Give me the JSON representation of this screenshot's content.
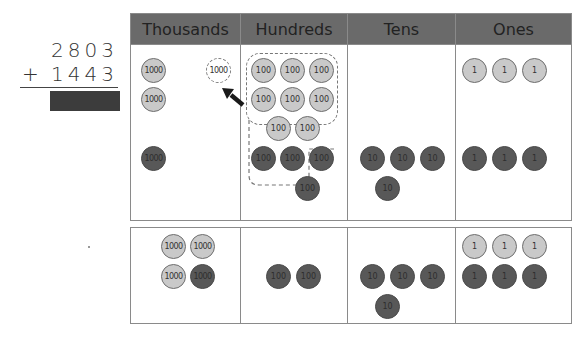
{
  "problem": {
    "addend1": "2803",
    "operator": "+",
    "addend2": "1443",
    "answer_hidden": true
  },
  "headers": [
    "Thousands",
    "Hundreds",
    "Tens",
    "Ones"
  ],
  "top_chart": {
    "thousands": {
      "light_discs": [
        "1000",
        "1000"
      ],
      "dark_discs": [
        "1000"
      ],
      "regrouped_ghost_disc": "1000"
    },
    "hundreds": {
      "light_discs": [
        "100",
        "100",
        "100",
        "100",
        "100",
        "100",
        "100",
        "100"
      ],
      "dark_discs": [
        "100",
        "100",
        "100",
        "100"
      ],
      "regrouped_group_count": 10
    },
    "tens": {
      "light_discs": [],
      "dark_discs": [
        "10",
        "10",
        "10",
        "10"
      ]
    },
    "ones": {
      "light_discs": [
        "1",
        "1",
        "1"
      ],
      "dark_discs": [
        "1",
        "1",
        "1"
      ]
    }
  },
  "bottom_chart": {
    "thousands": {
      "light_discs": [
        "1000",
        "1000",
        "1000"
      ],
      "dark_discs": [
        "1000"
      ]
    },
    "hundreds": {
      "light_discs": [],
      "dark_discs": [
        "100",
        "100"
      ]
    },
    "tens": {
      "light_discs": [],
      "dark_discs": [
        "10",
        "10",
        "10",
        "10"
      ]
    },
    "ones": {
      "light_discs": [
        "1",
        "1",
        "1"
      ],
      "dark_discs": [
        "1",
        "1",
        "1"
      ]
    }
  },
  "colors": {
    "header_bg": "#6a6a6a",
    "light_disc": "#c9c9c9",
    "dark_disc": "#585858",
    "answer_box": "#3c3c3c"
  }
}
